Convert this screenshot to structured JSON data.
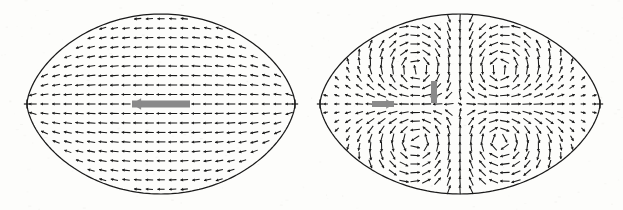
{
  "figure": {
    "title": "",
    "background_color": "#fdfdfb",
    "ink_color": "#1a1a1a",
    "highlight_color": "#8a8a8a",
    "width": 623,
    "height": 210
  },
  "chart_data": {
    "type": "scatter",
    "subtype": "vector-field-quiver-pair",
    "title": "",
    "xlabel": "",
    "ylabel": "",
    "grid": false,
    "legend": null,
    "axes_visible": false,
    "tick_labels": [],
    "panels": [
      {
        "id": "left-panel",
        "name": "translational-mode",
        "label": "",
        "domain_shape": "lens-with-cusps",
        "center": [
          161,
          104
        ],
        "cusp_left": [
          27,
          104
        ],
        "cusp_right": [
          295,
          104
        ],
        "top": [
          161,
          14
        ],
        "bottom": [
          161,
          193
        ],
        "half_width": 134,
        "half_height": 90,
        "flow_pattern": "uniform-translation",
        "vortex_count": 0,
        "grid_nx": 23,
        "grid_ny": 19,
        "arrow_scale": 7.0,
        "highlight_arrows": [
          {
            "name": "net-translation-arrow",
            "x": 161,
            "y": 104,
            "dx": -1,
            "dy": 0,
            "length": 58,
            "thickness": 7,
            "direction": "left",
            "color": "#8a8a8a"
          }
        ]
      },
      {
        "id": "right-panel",
        "name": "quadrupolar-mode",
        "label": "",
        "domain_shape": "lens-with-cusps",
        "center": [
          460,
          104
        ],
        "cusp_left": [
          320,
          104
        ],
        "cusp_right": [
          600,
          104
        ],
        "top": [
          460,
          14
        ],
        "bottom": [
          460,
          193
        ],
        "half_width": 140,
        "half_height": 90,
        "flow_pattern": "four-vortex-quadrupole",
        "vortex_count": 4,
        "vortices": [
          {
            "x": 417,
            "y": 70,
            "sense": "clockwise",
            "strength": 1.0
          },
          {
            "x": 500,
            "y": 70,
            "sense": "counterclockwise",
            "strength": 1.0
          },
          {
            "x": 417,
            "y": 140,
            "sense": "counterclockwise",
            "strength": 1.0
          },
          {
            "x": 500,
            "y": 140,
            "sense": "clockwise",
            "strength": 1.0
          }
        ],
        "grid_nx": 25,
        "grid_ny": 21,
        "arrow_scale": 7.0,
        "highlight_arrows": [
          {
            "name": "inflow-arrow-horizontal",
            "x": 383,
            "y": 104,
            "dx": 1,
            "dy": 0,
            "length": 22,
            "thickness": 6,
            "direction": "right",
            "color": "#8a8a8a"
          },
          {
            "name": "outflow-arrow-vertical",
            "x": 434,
            "y": 92,
            "dx": 0,
            "dy": 1,
            "length": 22,
            "thickness": 6,
            "direction": "down",
            "color": "#8a8a8a"
          }
        ]
      }
    ],
    "cusp_tick_marks": [
      {
        "panel": "left-panel",
        "x": 27,
        "y": 104,
        "size": 9
      },
      {
        "panel": "left-panel",
        "x": 295,
        "y": 104,
        "size": 9
      },
      {
        "panel": "right-panel",
        "x": 320,
        "y": 104,
        "size": 9
      },
      {
        "panel": "right-panel",
        "x": 600,
        "y": 104,
        "size": 9
      }
    ]
  }
}
